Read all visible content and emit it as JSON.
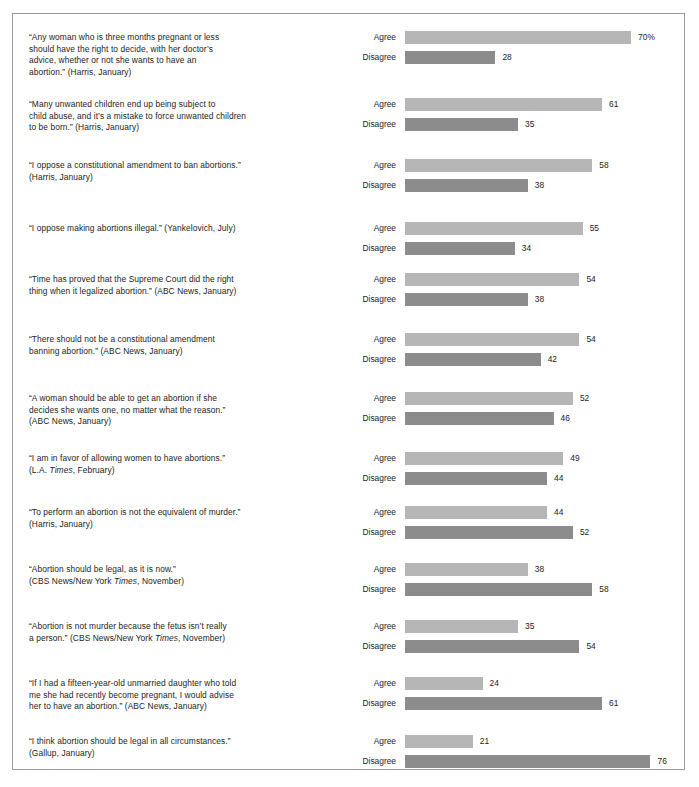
{
  "chart_data": {
    "type": "bar",
    "title": "",
    "subtitle": "",
    "xlabel": "",
    "ylabel": "",
    "xlim": [
      0,
      80
    ],
    "grid": false,
    "legend_position": "inline-row-labels",
    "orientation": "horizontal",
    "value_unit": "percent",
    "series": [
      {
        "name": "Agree",
        "color": "#b6b6b6",
        "values": [
          70,
          61,
          58,
          55,
          54,
          54,
          52,
          49,
          44,
          38,
          35,
          24,
          21
        ]
      },
      {
        "name": "Disagree",
        "color": "#8c8c8c",
        "values": [
          28,
          35,
          38,
          34,
          38,
          42,
          46,
          44,
          52,
          58,
          54,
          61,
          76
        ]
      }
    ],
    "categories": [
      "“Any woman who is three months pregnant or less should have the right to decide, with her doctor’s advice, whether or not she wants to have an abortion.” (Harris, January)",
      "“Many unwanted children end up being subject to child abuse, and it’s a mistake to force unwanted children to be born.” (Harris, January)",
      "“I oppose a constitutional amendment to ban abortions.” (Harris, January)",
      "“I oppose making abortions illegal.” (Yankelovich, July)",
      "“Time has proved that the Supreme Court did the right thing when it legalized abortion.” (ABC News, January)",
      "“There should not be a constitutional amendment banning abortion.” (ABC News, January)",
      "“A woman should be able to get an abortion if she decides she wants one, no matter what the reason.” (ABC News, January)",
      "“I am in favor of allowing women to have abortions.” (L.A. Times, February)",
      "“To perform an abortion is not the equivalent of murder.” (Harris, January)",
      "“Abortion should be legal, as it is now.” (CBS News/New York Times, November)",
      "“Abortion is not murder because the fetus isn’t really a person.” (CBS News/New York Times, November)",
      "“If I had a fifteen-year-old unmarried daughter who told me she had recently become pregnant, I would advise her to have an abortion.” (ABC News, January)",
      "“I think abortion should be legal in all circumstances.” (Gallup, January)"
    ]
  },
  "colors": {
    "agree_bar": "#b6b6b6",
    "disagree_bar": "#8c8c8c",
    "frame_border": "#9a9a9a",
    "text": "#1c1c1c",
    "background": "#ffffff"
  },
  "labels": {
    "agree": "Agree",
    "disagree": "Disagree"
  },
  "rows": [
    {
      "statement_lines": [
        "“Any woman who is three months pregnant or less",
        "should have the right to decide, with her doctor’s",
        "advice, whether or not she wants to have an",
        "abortion.” (Harris, January)"
      ],
      "statement_html": "“Any woman who is three months pregnant or less\nshould have the right to decide, with her doctor’s\nadvice, whether or not she wants to have an\nabortion.” (Harris, January)",
      "agree_value": 70,
      "agree_display": "70%",
      "disagree_value": 28,
      "disagree_display": "28"
    },
    {
      "statement_lines": [
        "“Many unwanted children end up being subject to",
        "child abuse, and it’s a mistake to force unwanted children",
        "to be born.” (Harris, January)"
      ],
      "statement_html": "“Many unwanted children end up being subject to\nchild abuse, and it’s a mistake to force unwanted children\nto be born.” (Harris, January)",
      "agree_value": 61,
      "agree_display": "61",
      "disagree_value": 35,
      "disagree_display": "35"
    },
    {
      "statement_lines": [
        "“I oppose a constitutional amendment to ban abortions.”",
        "(Harris, January)"
      ],
      "statement_html": "“I oppose a constitutional amendment to ban abortions.”\n(Harris, January)",
      "agree_value": 58,
      "agree_display": "58",
      "disagree_value": 38,
      "disagree_display": "38"
    },
    {
      "statement_lines": [
        "“I oppose making abortions illegal.” (Yankelovich, July)"
      ],
      "statement_html": "“I oppose making abortions illegal.” (Yankelovich, July)",
      "agree_value": 55,
      "agree_display": "55",
      "disagree_value": 34,
      "disagree_display": "34"
    },
    {
      "statement_lines": [
        "“Time has proved that the Supreme Court did the right",
        "thing when it legalized abortion.” (ABC News, January)"
      ],
      "statement_html": "“Time has proved that the Supreme Court did the right\nthing when it legalized abortion.” (ABC News, January)",
      "agree_value": 54,
      "agree_display": "54",
      "disagree_value": 38,
      "disagree_display": "38"
    },
    {
      "statement_lines": [
        "“There should not be a constitutional amendment",
        "banning abortion.” (ABC News, January)"
      ],
      "statement_html": "“There should not be a constitutional amendment\nbanning abortion.” (ABC News, January)",
      "agree_value": 54,
      "agree_display": "54",
      "disagree_value": 42,
      "disagree_display": "42"
    },
    {
      "statement_lines": [
        "“A woman should be able to get an abortion if she",
        "decides she wants one, no matter what the reason.”",
        "(ABC News, January)"
      ],
      "statement_html": "“A woman should be able to get an abortion if she\ndecides she wants one, no matter what the reason.”\n(ABC News, January)",
      "agree_value": 52,
      "agree_display": "52",
      "disagree_value": 46,
      "disagree_display": "46"
    },
    {
      "statement_lines": [
        "“I am in favor of allowing women to have abortions.”",
        "(L.A. Times, February)"
      ],
      "statement_html": "“I am in favor of allowing women to have abortions.”\n(L.A. <i>Times</i>, February)",
      "agree_value": 49,
      "agree_display": "49",
      "disagree_value": 44,
      "disagree_display": "44"
    },
    {
      "statement_lines": [
        "“To perform an abortion is not the equivalent of murder.”",
        "(Harris, January)"
      ],
      "statement_html": "“To perform an abortion is not the equivalent of murder.”\n(Harris, January)",
      "agree_value": 44,
      "agree_display": "44",
      "disagree_value": 52,
      "disagree_display": "52"
    },
    {
      "statement_lines": [
        "“Abortion should be legal, as it is now.”",
        "(CBS News/New York Times, November)"
      ],
      "statement_html": "“Abortion should be legal, as it is now.”\n(CBS News/New York <i>Times</i>, November)",
      "agree_value": 38,
      "agree_display": "38",
      "disagree_value": 58,
      "disagree_display": "58"
    },
    {
      "statement_lines": [
        "“Abortion is not murder because the fetus isn’t really",
        "a person.” (CBS News/New York Times, November)"
      ],
      "statement_html": "“Abortion is not murder because the fetus isn’t really\na person.” (CBS News/New York <i>Times</i>, November)",
      "agree_value": 35,
      "agree_display": "35",
      "disagree_value": 54,
      "disagree_display": "54"
    },
    {
      "statement_lines": [
        "“If I had a fifteen-year-old unmarried daughter who told",
        "me she had recently become pregnant, I would advise",
        "her to have an abortion.” (ABC News, January)"
      ],
      "statement_html": "“If I had a fifteen-year-old unmarried daughter who told\nme she had recently become pregnant, I would advise\nher to have an abortion.” (ABC News, January)",
      "agree_value": 24,
      "agree_display": "24",
      "disagree_value": 61,
      "disagree_display": "61"
    },
    {
      "statement_lines": [
        "“I think abortion should be legal in all circumstances.”",
        "(Gallup, January)"
      ],
      "statement_html": "“I think abortion should be legal in all circumstances.”\n(Gallup, January)",
      "agree_value": 21,
      "agree_display": "21",
      "disagree_value": 76,
      "disagree_display": "76"
    }
  ],
  "layout": {
    "row_tops": [
      17,
      84,
      145,
      208,
      259,
      319,
      378,
      438,
      492,
      549,
      606,
      663,
      721
    ],
    "bar_px_per_unit": 3.23,
    "bar_origin_x": 382
  }
}
